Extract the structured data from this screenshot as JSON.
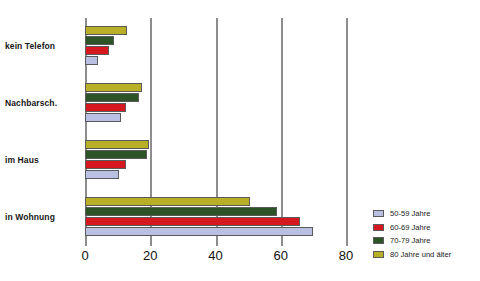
{
  "chart_data": {
    "type": "bar",
    "orientation": "horizontal",
    "title": "",
    "xlabel": "",
    "ylabel": "",
    "xlim": [
      0,
      80
    ],
    "xticks": [
      0,
      20,
      40,
      60,
      80
    ],
    "xtick_labels": [
      "0",
      "20",
      "40",
      "60",
      "80"
    ],
    "grid": true,
    "grid_axis": "x",
    "legend_position": "right",
    "categories": [
      "in Wohnung",
      "im Haus",
      "Nachbarsch.",
      "kein Telefon"
    ],
    "series": [
      {
        "name": "50-59 Jahre",
        "color": "#b9c0e2",
        "values": [
          70,
          10.5,
          11,
          4
        ]
      },
      {
        "name": "60-69 Jahre",
        "color": "#d51820",
        "values": [
          66,
          12.5,
          12.5,
          7.5
        ]
      },
      {
        "name": "70-79 Jahre",
        "color": "#2c5426",
        "values": [
          59,
          19,
          16.5,
          9
        ]
      },
      {
        "name": "80 Jahre und älter",
        "color": "#b8af27",
        "values": [
          50.5,
          19.7,
          17.5,
          13
        ]
      }
    ]
  },
  "axis": {
    "gridline_color": "#8d8d8d",
    "tick_label_color": "#111111"
  },
  "legend": {
    "items": [
      {
        "label": "50-59 Jahre",
        "color": "#b9c0e2"
      },
      {
        "label": "60-69 Jahre",
        "color": "#d51820"
      },
      {
        "label": "70-79 Jahre",
        "color": "#2c5426"
      },
      {
        "label": "80 Jahre und älter",
        "color": "#b8af27"
      }
    ]
  }
}
